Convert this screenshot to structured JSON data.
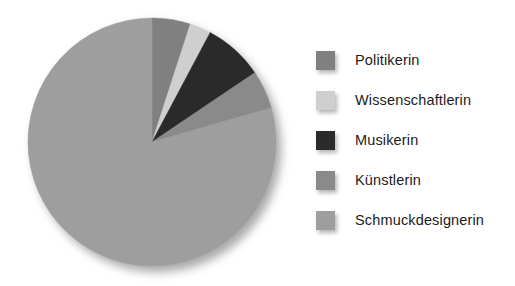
{
  "chart_data": {
    "type": "pie",
    "title": "",
    "subtitle": "",
    "xlabel": "",
    "ylabel": "",
    "grid": false,
    "legend_position": "right",
    "start_angle_deg": 0,
    "direction": "clockwise",
    "categories": [
      "Politikerin",
      "Wissenschaftlerin",
      "Musikerin",
      "Künstlerin",
      "Schmuckdesignerin"
    ],
    "values": [
      5,
      2.8,
      7.8,
      5,
      79.4
    ],
    "value_unit": "percent",
    "slice_angles_deg": [
      18,
      10,
      28,
      18,
      286
    ],
    "colors": [
      "#808080",
      "#cfcfcf",
      "#2b2b2b",
      "#8a8a8a",
      "#9e9e9e"
    ],
    "slices": [
      {
        "label": "Politikerin",
        "value": 5,
        "angle_deg": 18,
        "color": "#808080"
      },
      {
        "label": "Wissenschaftlerin",
        "value": 2.8,
        "angle_deg": 10,
        "color": "#cfcfcf"
      },
      {
        "label": "Musikerin",
        "value": 7.8,
        "angle_deg": 28,
        "color": "#2b2b2b"
      },
      {
        "label": "Künstlerin",
        "value": 5,
        "angle_deg": 18,
        "color": "#8a8a8a"
      },
      {
        "label": "Schmuckdesignerin",
        "value": 79.4,
        "angle_deg": 286,
        "color": "#9e9e9e"
      }
    ],
    "annotations": []
  },
  "legend": {
    "items": [
      {
        "label": "Politikerin",
        "color": "#808080"
      },
      {
        "label": "Wissenschaftlerin",
        "color": "#cfcfcf"
      },
      {
        "label": "Musikerin",
        "color": "#2b2b2b"
      },
      {
        "label": "Künstlerin",
        "color": "#8a8a8a"
      },
      {
        "label": "Schmuckdesignerin",
        "color": "#9e9e9e"
      }
    ]
  },
  "geometry": {
    "center_x": 140,
    "center_y": 140,
    "radius": 124
  }
}
